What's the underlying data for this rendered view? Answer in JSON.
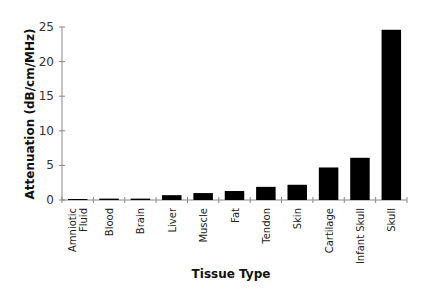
{
  "chart_data": {
    "type": "bar",
    "title": "",
    "xlabel": "Tissue Type",
    "ylabel": "Attenuation (dB/cm/MHz)",
    "ylim": [
      0,
      25
    ],
    "yticks": [
      0,
      5,
      10,
      15,
      20,
      25
    ],
    "grid": false,
    "legend": null,
    "bar_color": "#000000",
    "categories": [
      "Amniotic Fluid",
      "Blood",
      "Brain",
      "Liver",
      "Muscle",
      "Fat",
      "Tendon",
      "Skin",
      "Cartilage",
      "Infant Skull",
      "Skull"
    ],
    "category_lines": [
      [
        "Amniotic",
        "Fluid"
      ],
      [
        "Blood"
      ],
      [
        "Brain"
      ],
      [
        "Liver"
      ],
      [
        "Muscle"
      ],
      [
        "Fat"
      ],
      [
        "Tendon"
      ],
      [
        "Skin"
      ],
      [
        "Cartilage"
      ],
      [
        "Infant Skull"
      ],
      [
        "Skull"
      ]
    ],
    "values": [
      0.1,
      0.2,
      0.2,
      0.7,
      1.0,
      1.3,
      1.9,
      2.2,
      4.7,
      6.1,
      24.6
    ]
  }
}
